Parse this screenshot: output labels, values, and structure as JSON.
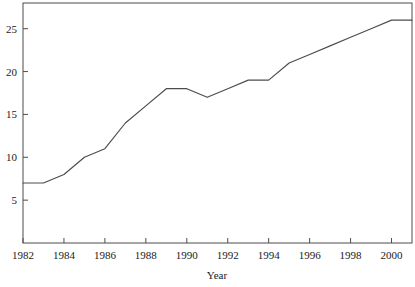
{
  "chart_data": {
    "type": "line",
    "title": "",
    "subtitle": "",
    "xlabel": "Year",
    "ylabel": "",
    "x": [
      1982,
      1983,
      1984,
      1985,
      1986,
      1987,
      1988,
      1989,
      1990,
      1991,
      1992,
      1993,
      1994,
      1995,
      1996,
      1997,
      1998,
      1999,
      2000,
      2001
    ],
    "values": [
      7,
      7,
      8,
      10,
      11,
      14,
      16,
      18,
      18,
      17,
      18,
      19,
      19,
      21,
      22,
      23,
      24,
      25,
      26,
      26
    ],
    "series": [
      {
        "name": "",
        "values": [
          7,
          7,
          8,
          10,
          11,
          14,
          16,
          18,
          18,
          17,
          18,
          19,
          19,
          21,
          22,
          23,
          24,
          25,
          26,
          26
        ]
      }
    ],
    "xlim": [
      1982,
      2001
    ],
    "ylim": [
      0,
      28
    ],
    "xticks": [
      1982,
      1984,
      1986,
      1988,
      1990,
      1992,
      1994,
      1996,
      1998,
      2000
    ],
    "xtick_labels": [
      "1982",
      "1984",
      "1986",
      "1988",
      "1990",
      "1992",
      "1994",
      "1996",
      "1998",
      "2000"
    ],
    "yticks": [
      5,
      10,
      15,
      20,
      25
    ],
    "ytick_labels": [
      "5",
      "10",
      "15",
      "20",
      "25"
    ],
    "grid": false,
    "legend": null,
    "line_color": "#4d4d4d",
    "frame_color": "#4d4d4d",
    "background_color": "#ffffff"
  }
}
